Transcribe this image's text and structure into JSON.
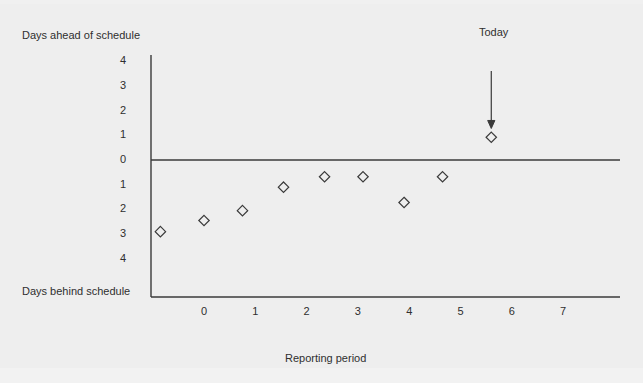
{
  "figure": {
    "background_color": "#eeeeee",
    "ink_color": "#3a3a3a"
  },
  "chart_data": {
    "type": "scatter",
    "title": "",
    "xlabel": "Reporting period",
    "ylabel_top": "Days ahead of schedule",
    "ylabel_bottom": "Days behind schedule",
    "grid": false,
    "legend": null,
    "xlim": [
      -1.2,
      8.2
    ],
    "ylim": [
      -4.5,
      4.5
    ],
    "xticks": [
      0,
      1,
      2,
      3,
      4,
      5,
      6,
      7
    ],
    "xtick_labels": [
      "0",
      "1",
      "2",
      "3",
      "4",
      "5",
      "6",
      "7"
    ],
    "yticks": [
      4,
      3,
      2,
      1,
      0,
      -1,
      -2,
      -3,
      -4
    ],
    "ytick_labels": [
      "4",
      "3",
      "2",
      "1",
      "0",
      "1",
      "2",
      "3",
      "4"
    ],
    "zero_line": 0,
    "marker": "diamond-open",
    "points": [
      {
        "x": -0.85,
        "y": -2.9
      },
      {
        "x": 0.0,
        "y": -2.45
      },
      {
        "x": 0.75,
        "y": -2.05
      },
      {
        "x": 1.55,
        "y": -1.1
      },
      {
        "x": 2.35,
        "y": -0.68
      },
      {
        "x": 3.1,
        "y": -0.68
      },
      {
        "x": 3.9,
        "y": -1.72
      },
      {
        "x": 4.65,
        "y": -0.68
      },
      {
        "x": 5.6,
        "y": 0.92
      }
    ],
    "annotations": [
      {
        "text": "Today",
        "target_x": 5.6,
        "label_y": 4.0,
        "arrow_from_y": 3.6,
        "arrow_to_y": 1.6
      }
    ]
  }
}
